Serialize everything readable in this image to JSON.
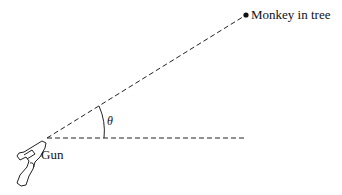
{
  "diagram": {
    "labels": {
      "monkey": "Monkey in tree",
      "gun": "Gun",
      "angle": "θ"
    },
    "geometry": {
      "gun_muzzle": [
        47,
        138
      ],
      "monkey_point": [
        246,
        15
      ],
      "horizontal_end": [
        245,
        138
      ]
    },
    "colors": {
      "line": "#222222",
      "background": "#ffffff"
    },
    "icons": [
      "revolver-icon"
    ]
  }
}
